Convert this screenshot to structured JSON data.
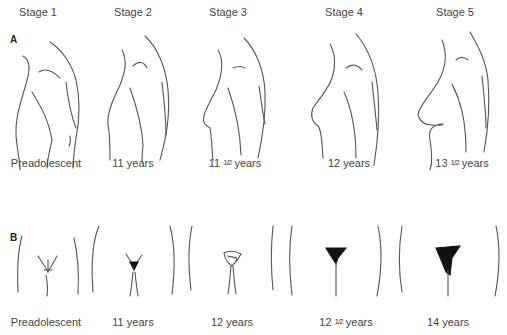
{
  "figure": {
    "stages": [
      {
        "label": "Stage 1",
        "x": 38
      },
      {
        "label": "Stage 2",
        "x": 133
      },
      {
        "label": "Stage 3",
        "x": 228
      },
      {
        "label": "Stage 4",
        "x": 344
      },
      {
        "label": "Stage 5",
        "x": 455
      }
    ],
    "panel_a": {
      "letter": "A",
      "title": "Breast development",
      "ages": [
        {
          "whole": "Preadolescent",
          "frac": "",
          "unit": "",
          "x": 46
        },
        {
          "whole": "11",
          "frac": "",
          "unit": " years",
          "x": 133
        },
        {
          "whole": "11",
          "frac": "1/2",
          "unit": " years",
          "x": 235
        },
        {
          "whole": "12",
          "frac": "",
          "unit": " years",
          "x": 349
        },
        {
          "whole": "13",
          "frac": "1/2",
          "unit": " years",
          "x": 462
        }
      ]
    },
    "panel_b": {
      "letter": "B",
      "title": "Pubic hair development",
      "ages": [
        {
          "whole": "Preadolescent",
          "frac": "",
          "unit": "",
          "x": 46
        },
        {
          "whole": "11",
          "frac": "",
          "unit": " years",
          "x": 133
        },
        {
          "whole": "12",
          "frac": "",
          "unit": " years",
          "x": 232
        },
        {
          "whole": "12",
          "frac": "1/2",
          "unit": " years",
          "x": 346
        },
        {
          "whole": "14",
          "frac": "",
          "unit": " years",
          "x": 448
        }
      ]
    }
  }
}
